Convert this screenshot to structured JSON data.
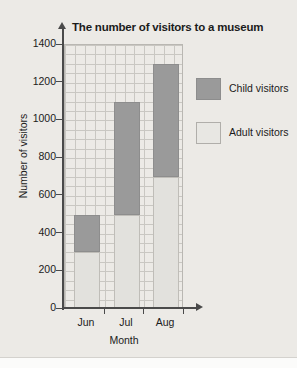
{
  "chart_data": {
    "type": "bar",
    "subtype": "stacked-bar",
    "title": "The number of visitors to a museum",
    "xlabel": "Month",
    "ylabel": "Number of visitors",
    "categories": [
      "Jun",
      "Jul",
      "Aug"
    ],
    "series": [
      {
        "name": "Adult visitors",
        "values": [
          300,
          500,
          700
        ],
        "color": "#e2e1dd"
      },
      {
        "name": "Child visitors",
        "values": [
          200,
          600,
          600
        ],
        "color": "#9a9a9a"
      }
    ],
    "totals": [
      500,
      1100,
      1300
    ],
    "ylim": [
      0,
      1400
    ],
    "ytick_labels": [
      "1400",
      "1200",
      "1000",
      "800",
      "600",
      "400",
      "200",
      "0"
    ],
    "ytick_values": [
      1400,
      1200,
      1000,
      800,
      600,
      400,
      200,
      0
    ],
    "major_tick_interval": 200,
    "minor_grid_interval": 50,
    "grid": true,
    "legend_position": "right",
    "legend": [
      {
        "label": "Child visitors",
        "swatch": "dark-gray"
      },
      {
        "label": "Adult visitors",
        "swatch": "light-gray"
      }
    ]
  },
  "colors": {
    "background": "#eceae6",
    "child": "#9a9a9a",
    "adult": "#e2e1dd",
    "axis": "#4a4a4a",
    "grid_major": "#a9a7a2",
    "grid_minor": "#c9c7c2",
    "text": "#1b1b1b"
  }
}
